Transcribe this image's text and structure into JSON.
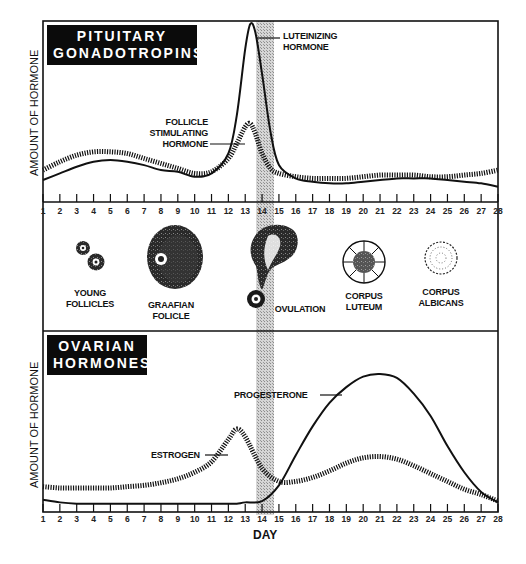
{
  "panels": {
    "pituitary": {
      "title_line1": "PITUITARY",
      "title_line2": "GONADOTROPINS",
      "ylabel": "AMOUNT OF HORMONE",
      "labels": {
        "lh_line1": "LUTEINIZING",
        "lh_line2": "HORMONE",
        "fsh_line1": "FOLLICLE",
        "fsh_line2": "STIMULATING",
        "fsh_line3": "HORMONE"
      }
    },
    "ovary": {
      "stages": [
        {
          "line1": "YOUNG",
          "line2": "FOLLICLES"
        },
        {
          "line1": "GRAAFIAN",
          "line2": "FOLICLE"
        },
        {
          "line1": "OVULATION",
          "line2": ""
        },
        {
          "line1": "CORPUS",
          "line2": "LUTEUM"
        },
        {
          "line1": "CORPUS",
          "line2": "ALBICANS"
        }
      ]
    },
    "ovarian": {
      "title_line1": "OVARIAN",
      "title_line2": "HORMONES",
      "ylabel": "AMOUNT OF HORMONE",
      "labels": {
        "progesterone": "PROGESTERONE",
        "estrogen": "ESTROGEN"
      }
    }
  },
  "xaxis": {
    "label": "DAY",
    "ticks": [
      "1",
      "2",
      "3",
      "4",
      "5",
      "6",
      "7",
      "8",
      "9",
      "10",
      "11",
      "12",
      "13",
      "14",
      "15",
      "16",
      "17",
      "18",
      "19",
      "20",
      "21",
      "22",
      "23",
      "24",
      "25",
      "26",
      "27",
      "28"
    ]
  },
  "colors": {
    "line": "#111111",
    "band": "#b8b8b8",
    "title_bg": "#0b0b0b",
    "title_fg": "#ffffff"
  },
  "chart_data": [
    {
      "type": "line",
      "title": "PITUITARY GONADOTROPINS",
      "xlabel": "DAY",
      "ylabel": "AMOUNT OF HORMONE",
      "x": [
        1,
        2,
        3,
        4,
        5,
        6,
        7,
        8,
        9,
        10,
        11,
        12,
        12.5,
        13,
        13.3,
        13.6,
        14,
        14.5,
        15,
        16,
        17,
        18,
        19,
        20,
        21,
        22,
        23,
        24,
        25,
        26,
        27,
        28
      ],
      "series": [
        {
          "name": "LUTEINIZING HORMONE",
          "style": "solid",
          "values": [
            6,
            10,
            14,
            17,
            18,
            17,
            15,
            12,
            11,
            8,
            10,
            22,
            45,
            85,
            100,
            95,
            70,
            35,
            15,
            7,
            5,
            4,
            4,
            5,
            6,
            7,
            7,
            7,
            6,
            5,
            4,
            2
          ]
        },
        {
          "name": "FOLLICLE STIMULATING HORMONE",
          "style": "hatched",
          "values": [
            12,
            17,
            21,
            23,
            23,
            22,
            19,
            16,
            13,
            10,
            11,
            19,
            28,
            38,
            40,
            34,
            22,
            13,
            10,
            8,
            7,
            7,
            7,
            8,
            9,
            9,
            9,
            8,
            8,
            9,
            10,
            12
          ]
        }
      ],
      "annotations": [
        "shaded ovulation band between day 14 and 15 (approx 13.6–14.6)"
      ],
      "grid": false
    },
    {
      "type": "line",
      "title": "OVARIAN HORMONES",
      "xlabel": "DAY",
      "ylabel": "AMOUNT OF HORMONE",
      "x": [
        1,
        2,
        3,
        4,
        5,
        6,
        7,
        8,
        9,
        10,
        11,
        12,
        12.5,
        13,
        14,
        15,
        16,
        17,
        18,
        19,
        20,
        21,
        22,
        23,
        24,
        25,
        26,
        27,
        28
      ],
      "series": [
        {
          "name": "PROGESTERONE",
          "style": "solid",
          "values": [
            4,
            2,
            1,
            1,
            1,
            1,
            1,
            1,
            1,
            1,
            1,
            1,
            1,
            2,
            3,
            15,
            38,
            60,
            78,
            90,
            98,
            100,
            97,
            85,
            68,
            45,
            25,
            10,
            2
          ]
        },
        {
          "name": "ESTROGEN",
          "style": "hatched",
          "values": [
            14,
            13,
            13,
            13,
            13,
            14,
            15,
            17,
            20,
            25,
            33,
            50,
            58,
            52,
            28,
            18,
            18,
            21,
            26,
            32,
            36,
            37,
            35,
            30,
            24,
            18,
            12,
            8,
            3
          ]
        }
      ],
      "grid": false
    }
  ],
  "stages_diagram": {
    "type": "illustration",
    "items": [
      "YOUNG FOLLICLES",
      "GRAAFIAN FOLICLE",
      "OVULATION",
      "CORPUS LUTEUM",
      "CORPUS ALBICANS"
    ]
  }
}
